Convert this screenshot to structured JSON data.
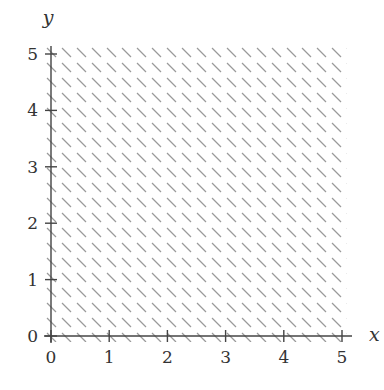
{
  "chart_data": {
    "type": "area",
    "title": "",
    "xlabel": "x",
    "ylabel": "y",
    "xlim": [
      0,
      5
    ],
    "ylim": [
      0,
      5
    ],
    "x_ticks": [
      "0",
      "1",
      "2",
      "3",
      "4",
      "5"
    ],
    "y_ticks": [
      "0",
      "1",
      "2",
      "3",
      "4",
      "5"
    ],
    "grid": false,
    "legend": null,
    "regions": [
      {
        "name": "shaded-region",
        "fill": "hatch",
        "hatch_direction": "diagonal-down",
        "x_range": [
          0,
          5
        ],
        "y_range": [
          0,
          5
        ]
      }
    ],
    "colors": {
      "axis": "#444444",
      "hatch": "#9a9a9a",
      "text": "#333333"
    }
  }
}
